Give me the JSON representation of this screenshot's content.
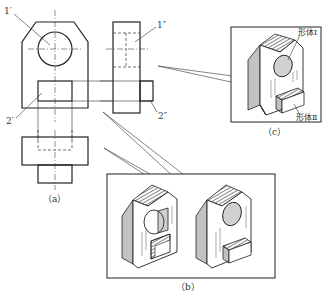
{
  "figure": {
    "view_a": {
      "caption": "（a）",
      "labels": {
        "front_1": "1′",
        "side_1": "1″",
        "front_2": "2′",
        "side_2": "2″"
      }
    },
    "view_b": {
      "caption": "（b）"
    },
    "view_c": {
      "caption": "（c）",
      "labels": {
        "body_1": "形体Ⅰ",
        "body_2": "形体Ⅱ"
      }
    }
  },
  "colors": {
    "line": "#222222",
    "background": "#ffffff",
    "hatch": "#333333"
  }
}
